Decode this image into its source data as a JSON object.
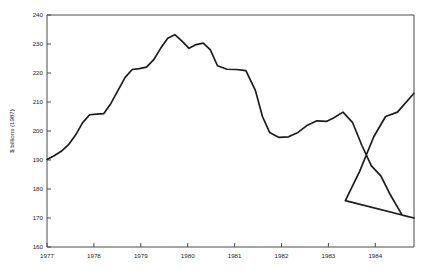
{
  "chart_data": {
    "type": "line",
    "title": "",
    "xlabel": "",
    "ylabel": "$ billions (1987)",
    "xlim": [
      1977.0,
      1984.75
    ],
    "ylim": [
      160,
      240
    ],
    "ytick_labels": [
      "160",
      "170",
      "180",
      "190",
      "200",
      "210",
      "220",
      "230",
      "240"
    ],
    "ytick_values": [
      160,
      170,
      180,
      190,
      200,
      210,
      220,
      230,
      240
    ],
    "xtick_labels": [
      "1977",
      "1978",
      "1979",
      "1980",
      "1981",
      "1982",
      "1983",
      "1984"
    ],
    "xtick_values": [
      1977,
      1978,
      1979,
      1980,
      1981,
      1982,
      1983,
      1984
    ],
    "grid": false,
    "legend": "none",
    "line_color": "#1c1c1c",
    "frame_color": "#4a4a4a",
    "background_color": "#ffffff",
    "series": [
      {
        "name": "real value",
        "x": [
          1977.0,
          1977.15,
          1977.3,
          1977.45,
          1977.6,
          1977.75,
          1977.9,
          1978.05,
          1978.2,
          1978.35,
          1978.5,
          1978.65,
          1978.8,
          1978.95,
          1979.1,
          1979.25,
          1979.4,
          1979.55,
          1979.7,
          1979.85,
          1980.0,
          1980.15,
          1980.3,
          1980.45,
          1980.6,
          1980.8,
          1981.0,
          1981.2,
          1981.4,
          1981.55,
          1981.7,
          1981.9,
          1982.1,
          1982.3,
          1982.5,
          1982.7,
          1982.9,
          1983.05,
          1983.25,
          1983.45,
          1983.65,
          1983.85,
          1984.05,
          1984.25,
          1984.5,
          1984.75
        ],
        "y": [
          190.2,
          191.5,
          193.0,
          195.2,
          198.5,
          202.8,
          205.6,
          205.8,
          206.0,
          209.5,
          214.0,
          218.5,
          221.2,
          221.5,
          222.0,
          224.5,
          228.5,
          232.0,
          233.2,
          231.0,
          228.5,
          229.8,
          230.3,
          228.0,
          222.5,
          221.3,
          221.2,
          220.8,
          214.0,
          205.0,
          199.5,
          197.8,
          198.0,
          199.5,
          202.0,
          203.5,
          203.3,
          204.5,
          206.5,
          203.0,
          195.0,
          188.0,
          184.5,
          178.0,
          171.0,
          170.0
        ]
      }
    ],
    "series_extension": {
      "note": "continuation of recovery to end of range",
      "x": [
        1983.0,
        1983.3,
        1983.6,
        1983.9,
        1984.15,
        1984.4,
        1984.75
      ],
      "y": [
        170.0,
        176.0,
        186.0,
        198.0,
        205.0,
        206.5,
        213.0
      ]
    },
    "curve_path": "M 47,156.3 C 53,154.2 58,151.5 63,147.0 C 68,142.4 73,135.0 78,130.5 C 81,127.8 84,126.8 88,126.5 C 92,126.3 95,126.5 98,124.0 C 103,119.5 108,110.0 113,101.0 C 117,94.0 120,89.0 124,85.8 C 128,82.3 131,78.0 134,68.0 C 136,61.0 137,53.0 139,45.5 C 141,39.5 143,36.8 145,37.2 C 147,37.8 149,42.0 151,48.0 C 153,53.5 155,57.2 157,57.8 C 159,58.2 161,55.0 163,50.0 C 165,46.0 167,44.2 169,44.5 C 171,45.0 173,48.5 175,54.5 C 178,63.5 181,70.5 184,73.0 C 187,75.0 190,74.8 193,74.5 C 196,74.3 199,74.2 202,76.5 C 205,80.0 208,89.5 212,105.0 C 216,120.0 219,130.0 222,134.5 C 225,137.8 228,138.5 231,138.0 C 235,137.2 239,134.0 243,130.0 C 247,126.2 250,123.2 253,121.5 C 256,120.0 259,120.2 262,120.0 C 265,119.8 268,119.5 271,117.0 C 274,114.2 277,112.2 280,112.8 C 283,113.5 286,117.5 290,124.5 C 295,133.5 300,145.0 305,156.0 C 309,164.5 312,170.5 315,174.5 C 318,178.0 321,179.5 324,180.5 C 327,181.5 330,182.0 333,186.0 C 336,190.5 339,199.0 343,209.0 C 346,215.5 348,218.5 350,218.8 C 352,219.0 354,216.5 357,211.0 C 360,205.0 363,196.5 366,188.0 C 369,180.0 372,172.0 375,166.0 C 378,160.5 380,157.0 382,115.5 C 382,115.5 382,115.5 382,115.5 L 382,115.5"
  },
  "axis_labels": {
    "y": [
      "240",
      "230",
      "220",
      "210",
      "200",
      "190",
      "180",
      "170",
      "160"
    ],
    "x": [
      "1977",
      "1978",
      "1979",
      "1980",
      "1981",
      "1982",
      "1983",
      "1984"
    ],
    "y_title": "$ billions (1987)"
  }
}
